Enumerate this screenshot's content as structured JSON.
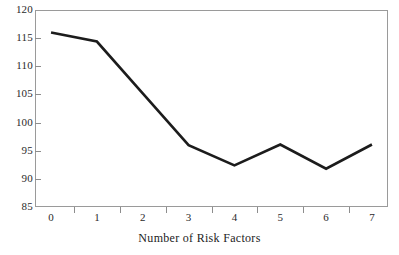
{
  "chart_data": {
    "type": "line",
    "title": "",
    "subtitle": "",
    "xlabel": "Number of Risk Factors",
    "ylabel": "",
    "x": [
      0,
      1,
      2,
      3,
      4,
      5,
      6,
      7
    ],
    "values": [
      116.0,
      114.4,
      105.2,
      96.0,
      92.4,
      96.1,
      91.8,
      96.1
    ],
    "categories": [
      "0",
      "1",
      "2",
      "3",
      "4",
      "5",
      "6",
      "7"
    ],
    "xtick_labels": [
      "0",
      "1",
      "2",
      "3",
      "4",
      "5",
      "6",
      "7"
    ],
    "ytick_labels": [
      "120",
      "115",
      "110",
      "105",
      "100",
      "95",
      "90",
      "85"
    ],
    "ytick_values": [
      120,
      115,
      110,
      105,
      100,
      95,
      90,
      85
    ],
    "ylim": [
      85,
      120
    ],
    "xlim": [
      -0.35,
      7.35
    ],
    "grid": false,
    "legend": null,
    "legend_position": "none",
    "line_color": "#1c1c1c",
    "axis_color": "#9a9a9a",
    "background_color": "#ffffff",
    "annotations": []
  },
  "axes": {
    "x_title": "Number of Risk Factors",
    "y_title": ""
  }
}
